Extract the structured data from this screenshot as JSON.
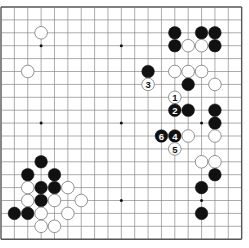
{
  "board": {
    "size": 19,
    "origin_x": 1,
    "origin_y": 7,
    "step_x": 13.37,
    "step_y": 12.9,
    "stone_radius": 6.3,
    "colors": {
      "background": "#ffffff",
      "line": "#8a8a8a",
      "border": "#555555",
      "black_stone": "#111111",
      "white_stone": "#ffffff",
      "white_stone_edge": "#777777",
      "star_point": "#111111"
    },
    "star_points": [
      [
        3,
        3
      ],
      [
        9,
        3
      ],
      [
        15,
        3
      ],
      [
        3,
        9
      ],
      [
        9,
        9
      ],
      [
        15,
        9
      ],
      [
        3,
        15
      ],
      [
        9,
        15
      ],
      [
        15,
        15
      ]
    ]
  },
  "stones": [
    {
      "color": "white",
      "col": 3,
      "row": 2,
      "label": ""
    },
    {
      "color": "white",
      "col": 2,
      "row": 5,
      "label": ""
    },
    {
      "color": "black",
      "col": 13,
      "row": 2,
      "label": ""
    },
    {
      "color": "black",
      "col": 15,
      "row": 2,
      "label": ""
    },
    {
      "color": "black",
      "col": 16,
      "row": 2,
      "label": ""
    },
    {
      "color": "black",
      "col": 13,
      "row": 3,
      "label": ""
    },
    {
      "color": "white",
      "col": 14,
      "row": 3,
      "label": ""
    },
    {
      "color": "white",
      "col": 15,
      "row": 3,
      "label": ""
    },
    {
      "color": "black",
      "col": 16,
      "row": 3,
      "label": ""
    },
    {
      "color": "black",
      "col": 11,
      "row": 5,
      "label": ""
    },
    {
      "color": "white",
      "col": 13,
      "row": 5,
      "label": ""
    },
    {
      "color": "white",
      "col": 14,
      "row": 5,
      "label": ""
    },
    {
      "color": "white",
      "col": 15,
      "row": 5,
      "label": ""
    },
    {
      "color": "white",
      "col": 11,
      "row": 6,
      "label": "3"
    },
    {
      "color": "black",
      "col": 14,
      "row": 6,
      "label": ""
    },
    {
      "color": "white",
      "col": 16,
      "row": 6,
      "label": ""
    },
    {
      "color": "white",
      "col": 13,
      "row": 7,
      "label": "1"
    },
    {
      "color": "black",
      "col": 13,
      "row": 8,
      "label": "2"
    },
    {
      "color": "black",
      "col": 14,
      "row": 8,
      "label": ""
    },
    {
      "color": "black",
      "col": 16,
      "row": 8,
      "label": ""
    },
    {
      "color": "black",
      "col": 16,
      "row": 9,
      "label": ""
    },
    {
      "color": "black",
      "col": 12,
      "row": 10,
      "label": "6"
    },
    {
      "color": "black",
      "col": 13,
      "row": 10,
      "label": "4"
    },
    {
      "color": "white",
      "col": 14,
      "row": 10,
      "label": ""
    },
    {
      "color": "white",
      "col": 16,
      "row": 10,
      "label": ""
    },
    {
      "color": "white",
      "col": 13,
      "row": 11,
      "label": "5"
    },
    {
      "color": "white",
      "col": 15,
      "row": 12,
      "label": ""
    },
    {
      "color": "white",
      "col": 16,
      "row": 12,
      "label": ""
    },
    {
      "color": "black",
      "col": 16,
      "row": 13,
      "label": ""
    },
    {
      "color": "black",
      "col": 15,
      "row": 14,
      "label": ""
    },
    {
      "color": "black",
      "col": 15,
      "row": 16,
      "label": ""
    },
    {
      "color": "black",
      "col": 3,
      "row": 12,
      "label": ""
    },
    {
      "color": "black",
      "col": 2,
      "row": 13,
      "label": ""
    },
    {
      "color": "black",
      "col": 4,
      "row": 13,
      "label": ""
    },
    {
      "color": "white",
      "col": 2,
      "row": 14,
      "label": ""
    },
    {
      "color": "black",
      "col": 3,
      "row": 14,
      "label": ""
    },
    {
      "color": "black",
      "col": 4,
      "row": 14,
      "label": ""
    },
    {
      "color": "white",
      "col": 5,
      "row": 14,
      "label": ""
    },
    {
      "color": "white",
      "col": 2,
      "row": 15,
      "label": ""
    },
    {
      "color": "black",
      "col": 3,
      "row": 15,
      "label": ""
    },
    {
      "color": "white",
      "col": 4,
      "row": 15,
      "label": ""
    },
    {
      "color": "white",
      "col": 6,
      "row": 15,
      "label": ""
    },
    {
      "color": "black",
      "col": 1,
      "row": 16,
      "label": ""
    },
    {
      "color": "black",
      "col": 2,
      "row": 16,
      "label": ""
    },
    {
      "color": "white",
      "col": 3,
      "row": 16,
      "label": ""
    },
    {
      "color": "white",
      "col": 5,
      "row": 16,
      "label": ""
    },
    {
      "color": "white",
      "col": 3,
      "row": 17,
      "label": ""
    },
    {
      "color": "white",
      "col": 4,
      "row": 17,
      "label": ""
    }
  ]
}
